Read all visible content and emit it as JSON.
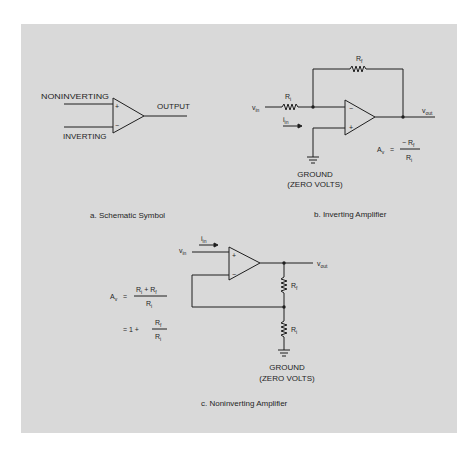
{
  "figure": {
    "background": "#d9d9d9",
    "line_color": "#1f1f1f"
  },
  "panel_a": {
    "caption": "a. Schematic Symbol",
    "noninverting_label": "NONINVERTING",
    "inverting_label": "INVERTING",
    "output_label": "OUTPUT",
    "plus_sign": "+",
    "minus_sign": "−"
  },
  "panel_b": {
    "caption": "b. Inverting Amplifier",
    "vin": "v",
    "vin_sub": "in",
    "vout": "v",
    "vout_sub": "out",
    "ri": "R",
    "ri_sub": "i",
    "rf": "R",
    "rf_sub": "f",
    "iin": "i",
    "iin_sub": "in",
    "plus_sign": "+",
    "minus_sign": "−",
    "ground_line1": "GROUND",
    "ground_line2": "(ZERO VOLTS)",
    "gain": {
      "lhs": "A",
      "lhs_sub": "v",
      "eq": "=",
      "numerator": "− R",
      "numerator_sub": "f",
      "denominator": "R",
      "denominator_sub": "i"
    }
  },
  "panel_c": {
    "caption": "c. Noninverting Amplifier",
    "vin": "v",
    "vin_sub": "in",
    "vout": "v",
    "vout_sub": "out",
    "ri": "R",
    "ri_sub": "i",
    "rf": "R",
    "rf_sub": "f",
    "iin": "i",
    "iin_sub": "in",
    "plus_sign": "+",
    "minus_sign": "−",
    "ground_line1": "GROUND",
    "ground_line2": "(ZERO VOLTS)",
    "gain": {
      "lhs": "A",
      "lhs_sub": "v",
      "eq": "=",
      "num_a": "R",
      "num_a_sub": "i",
      "num_plus": "+",
      "num_b": "R",
      "num_b_sub": "f",
      "den": "R",
      "den_sub": "i",
      "eq2": "= 1 +",
      "frac2_num": "R",
      "frac2_num_sub": "f",
      "frac2_den": "R",
      "frac2_den_sub": "i"
    }
  }
}
